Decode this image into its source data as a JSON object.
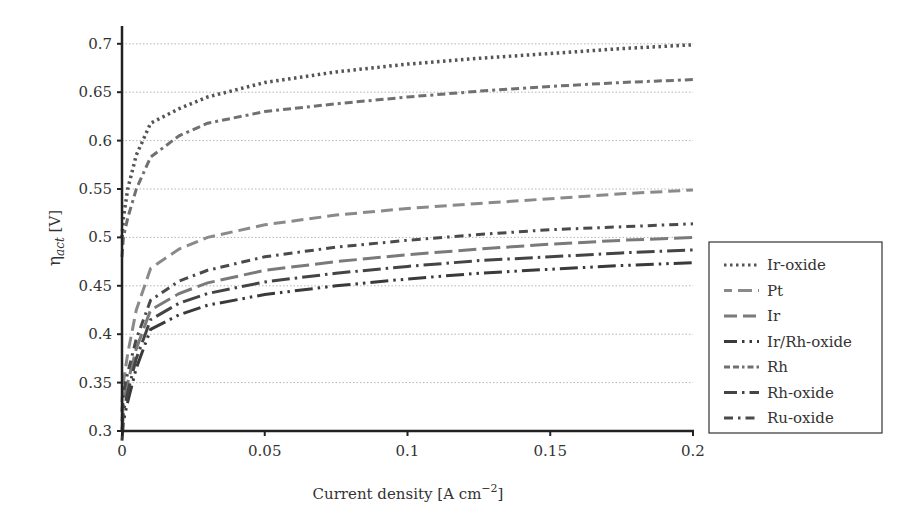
{
  "chart_data": {
    "type": "line",
    "title": "",
    "xlabel": "Current density [A cm⁻²]",
    "xlabel_main": "Current density [A cm",
    "xlabel_sup": "−2",
    "xlabel_end": "]",
    "ylabel": "ηact [V]",
    "ylabel_eta": "η",
    "ylabel_sub": "act",
    "ylabel_unit": " [V]",
    "xlim": [
      0,
      0.2
    ],
    "ylim": [
      0.3,
      0.72
    ],
    "xticks": [
      0,
      0.05,
      0.1,
      0.15,
      0.2
    ],
    "xtick_labels": [
      "0",
      "0.05",
      "0.1",
      "0.15",
      "0.2"
    ],
    "yticks": [
      0.3,
      0.35,
      0.4,
      0.45,
      0.5,
      0.55,
      0.6,
      0.65,
      0.7
    ],
    "ytick_labels": [
      "0.3",
      "0.35",
      "0.4",
      "0.45",
      "0.5",
      "0.55",
      "0.6",
      "0.65",
      "0.7"
    ],
    "grid": "horizontal dotted",
    "legend_position": "right",
    "x": [
      0.0005,
      0.002,
      0.005,
      0.01,
      0.02,
      0.03,
      0.05,
      0.075,
      0.1,
      0.125,
      0.15,
      0.175,
      0.2
    ],
    "series": [
      {
        "name": "Ir-oxide",
        "style": "dotted",
        "color": "#555555",
        "values": [
          0.52,
          0.55,
          0.585,
          0.618,
          0.633,
          0.645,
          0.66,
          0.671,
          0.679,
          0.685,
          0.69,
          0.695,
          0.699
        ]
      },
      {
        "name": "Pt",
        "style": "dashed",
        "color": "#8a8a8a",
        "values": [
          0.35,
          0.38,
          0.425,
          0.468,
          0.488,
          0.5,
          0.513,
          0.523,
          0.53,
          0.535,
          0.54,
          0.545,
          0.549
        ]
      },
      {
        "name": "Ir",
        "style": "long-dash",
        "color": "#7a7a7a",
        "values": [
          0.33,
          0.35,
          0.385,
          0.425,
          0.442,
          0.453,
          0.466,
          0.475,
          0.482,
          0.488,
          0.493,
          0.497,
          0.5
        ]
      },
      {
        "name": "Ir/Rh-oxide",
        "style": "long-dash-dot-dot",
        "color": "#3a3a3a",
        "values": [
          0.31,
          0.33,
          0.365,
          0.405,
          0.42,
          0.43,
          0.441,
          0.45,
          0.457,
          0.463,
          0.467,
          0.471,
          0.474
        ]
      },
      {
        "name": "Rh",
        "style": "dash-dot",
        "color": "#707070",
        "values": [
          0.5,
          0.52,
          0.55,
          0.583,
          0.605,
          0.618,
          0.63,
          0.638,
          0.645,
          0.651,
          0.656,
          0.66,
          0.663
        ]
      },
      {
        "name": "Rh-oxide",
        "style": "long-dash-dot",
        "color": "#444444",
        "values": [
          0.32,
          0.34,
          0.375,
          0.415,
          0.432,
          0.442,
          0.454,
          0.463,
          0.47,
          0.476,
          0.48,
          0.484,
          0.487
        ]
      },
      {
        "name": "Ru-oxide",
        "style": "dash-dot",
        "color": "#4a4a4a",
        "values": [
          0.34,
          0.36,
          0.395,
          0.435,
          0.455,
          0.466,
          0.48,
          0.49,
          0.497,
          0.503,
          0.508,
          0.511,
          0.514
        ]
      }
    ]
  },
  "legend": {
    "items": [
      "Ir-oxide",
      "Pt",
      "Ir",
      "Ir/Rh-oxide",
      "Rh",
      "Rh-oxide",
      "Ru-oxide"
    ]
  }
}
